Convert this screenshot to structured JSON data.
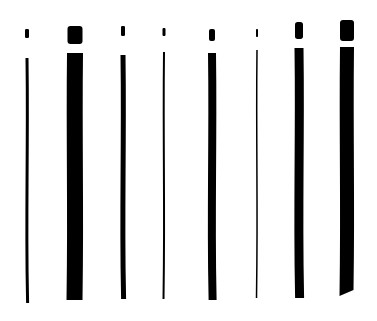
{
  "illustration": {
    "description": "Eight hand-drawn ink letter-i strokes of varying nib widths",
    "background": "#ffffff",
    "ink": "#000000",
    "strokes": [
      {
        "x": 27,
        "dot": {
          "y1": 29,
          "y2": 38,
          "w": 4
        },
        "stem": {
          "y1": 58,
          "y2": 303,
          "w": 3
        }
      },
      {
        "x": 75,
        "dot": {
          "y1": 26,
          "y2": 44,
          "w": 15
        },
        "stem": {
          "y1": 53,
          "y2": 300,
          "w": 16
        }
      },
      {
        "x": 123,
        "dot": {
          "y1": 26,
          "y2": 36,
          "w": 4
        },
        "stem": {
          "y1": 55,
          "y2": 299,
          "w": 5
        }
      },
      {
        "x": 164,
        "dot": {
          "y1": 28,
          "y2": 36,
          "w": 3
        },
        "stem": {
          "y1": 52,
          "y2": 299,
          "w": 2
        }
      },
      {
        "x": 212,
        "dot": {
          "y1": 29,
          "y2": 41,
          "w": 6
        },
        "stem": {
          "y1": 53,
          "y2": 300,
          "w": 8
        }
      },
      {
        "x": 257,
        "dot": {
          "y1": 29,
          "y2": 37,
          "w": 2
        },
        "stem": {
          "y1": 50,
          "y2": 298,
          "w": 1.5
        }
      },
      {
        "x": 299,
        "dot": {
          "y1": 22,
          "y2": 39,
          "w": 8
        },
        "stem": {
          "y1": 48,
          "y2": 298,
          "w": 9
        }
      },
      {
        "x": 347,
        "dot": {
          "y1": 20,
          "y2": 41,
          "w": 14
        },
        "stem": {
          "y1": 47,
          "y2": 296,
          "w": 14
        }
      }
    ]
  }
}
